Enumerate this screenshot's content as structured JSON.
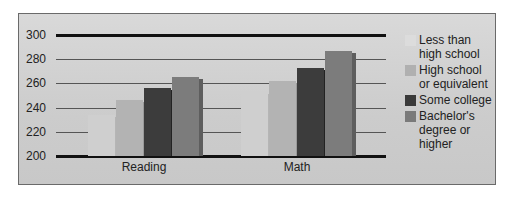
{
  "chart_data": {
    "type": "bar",
    "title": "",
    "xlabel": "",
    "ylabel": "",
    "ylim": [
      200,
      300
    ],
    "yticks": [
      "300",
      "280",
      "260",
      "240",
      "220",
      "200"
    ],
    "categories": [
      "Reading",
      "Math"
    ],
    "series": [
      {
        "name": "Less than high school",
        "color": "#c8c8c8",
        "values": [
          234,
          253
        ]
      },
      {
        "name": "High school or equivalent",
        "color": "#a9a9a9",
        "values": [
          246,
          262
        ]
      },
      {
        "name": "Some college",
        "color": "#3a3a3a",
        "values": [
          256,
          273
        ]
      },
      {
        "name": "Bachelor's degree or higher",
        "color": "#7a7a7a",
        "values": [
          265,
          287
        ]
      }
    ],
    "grid": true,
    "legend_position": "right"
  },
  "legend": {
    "items": [
      {
        "label": "Less than high school",
        "color": "#dcdcdc"
      },
      {
        "label": "High school or equivalent",
        "color": "#b0b0b0"
      },
      {
        "label": "Some college",
        "color": "#3a3a3a"
      },
      {
        "label": "Bachelor's degree or higher",
        "color": "#7a7a7a"
      }
    ]
  }
}
